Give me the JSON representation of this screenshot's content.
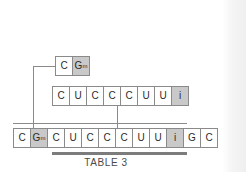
{
  "figure": {
    "caption": "TABLE 3",
    "colors": {
      "cell_border": "#8a8a8a",
      "cell_fill": "#ffffff",
      "cell_shaded_fill": "#c9c9c9",
      "connector": "#8a8a8a",
      "rule": "#7c7c7c",
      "text": "#2b2b2b",
      "caption_text": "#4a4a4a",
      "background": "#ffffff"
    },
    "rows": {
      "top": {
        "name": "fragment-1",
        "cells": [
          {
            "base": "C",
            "sup": "",
            "shaded": false
          },
          {
            "base": "G",
            "sup": "m",
            "shaded": true
          }
        ]
      },
      "middle": {
        "name": "fragment-2",
        "cells": [
          {
            "base": "C",
            "sup": "",
            "shaded": false
          },
          {
            "base": "U",
            "sup": "",
            "shaded": false
          },
          {
            "base": "C",
            "sup": "",
            "shaded": false
          },
          {
            "base": "C",
            "sup": "",
            "shaded": false
          },
          {
            "base": "C",
            "sup": "",
            "shaded": false
          },
          {
            "base": "U",
            "sup": "",
            "shaded": false
          },
          {
            "base": "U",
            "sup": "",
            "shaded": false
          },
          {
            "base": "i",
            "sup": "",
            "shaded": true
          }
        ]
      },
      "bottom": {
        "name": "assembled-sequence",
        "cells": [
          {
            "base": "C",
            "sup": "",
            "shaded": false
          },
          {
            "base": "G",
            "sup": "m",
            "shaded": true
          },
          {
            "base": "C",
            "sup": "",
            "shaded": false
          },
          {
            "base": "U",
            "sup": "",
            "shaded": false
          },
          {
            "base": "C",
            "sup": "",
            "shaded": false
          },
          {
            "base": "C",
            "sup": "",
            "shaded": false
          },
          {
            "base": "C",
            "sup": "",
            "shaded": false
          },
          {
            "base": "U",
            "sup": "",
            "shaded": false
          },
          {
            "base": "U",
            "sup": "",
            "shaded": false
          },
          {
            "base": "i",
            "sup": "",
            "shaded": true
          },
          {
            "base": "G",
            "sup": "",
            "shaded": false
          },
          {
            "base": "C",
            "sup": "",
            "shaded": false
          }
        ]
      }
    }
  }
}
